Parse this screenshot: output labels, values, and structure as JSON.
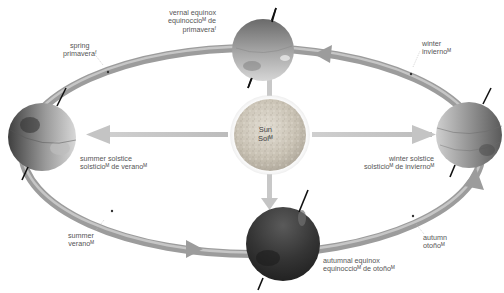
{
  "diagram": {
    "type": "earth-orbit-seasons",
    "colors": {
      "orbit": "#9a9a9a",
      "orbit_highlight": "#c8c8c8",
      "sun_rays": "#c4c4c4",
      "sun": "#c9c2b4",
      "earth_light": "#b9b9b9",
      "earth_dark": "#3a3a3a",
      "axis": "#111111",
      "label": "#555555"
    },
    "sun": {
      "label_en": "Sun",
      "label_es": "Sol",
      "marker": "M"
    },
    "positions": [
      {
        "id": "vernal-equinox",
        "en": "vernal equinox",
        "es": "equinoccio",
        "es_marker": "M",
        "es_line2": "de",
        "es_line3": "primavera",
        "es_line3_marker": "F"
      },
      {
        "id": "summer-solstice",
        "en": "summer solstice",
        "es": "solsticio",
        "es_marker": "M",
        "es_tail": "de verano",
        "es_tail_marker": "M"
      },
      {
        "id": "winter-solstice",
        "en": "winter solstice",
        "es": "solsticio",
        "es_marker": "M",
        "es_tail": "de invierno",
        "es_tail_marker": "M"
      },
      {
        "id": "autumnal-equinox",
        "en": "autumnal equinox",
        "es": "equinoccio",
        "es_marker": "M",
        "es_tail": "de otoño",
        "es_tail_marker": "M"
      }
    ],
    "seasons": [
      {
        "id": "spring",
        "en": "spring",
        "es": "primavera",
        "marker": "F"
      },
      {
        "id": "winter",
        "en": "winter",
        "es": "invierno",
        "marker": "M"
      },
      {
        "id": "summer",
        "en": "summer",
        "es": "verano",
        "marker": "M"
      },
      {
        "id": "autumn",
        "en": "autumn",
        "es": "otoño",
        "marker": "M"
      }
    ],
    "labels": {
      "vernal_l1": "vernal equinox",
      "vernal_l2": "equinoccioᴹ de",
      "vernal_l3": "primaveraᶠ",
      "summer_sol_l1": "summer solstice",
      "summer_sol_l2": "solsticioᴹ de veranoᴹ",
      "winter_sol_l1": "winter solstice",
      "winter_sol_l2": "solsticioᴹ de inviernoᴹ",
      "autumnal_l1": "autumnal equinox",
      "autumnal_l2": "equinoccioᴹ de otoñoᴹ",
      "spring_l1": "spring",
      "spring_l2": "primaveraᶠ",
      "winter_l1": "winter",
      "winter_l2": "inviernoᴹ",
      "summer_l1": "summer",
      "summer_l2": "veranoᴹ",
      "autumn_l1": "autumn",
      "autumn_l2": "otoñoᴹ",
      "sun_l1": "Sun",
      "sun_l2": "Solᴹ"
    }
  }
}
